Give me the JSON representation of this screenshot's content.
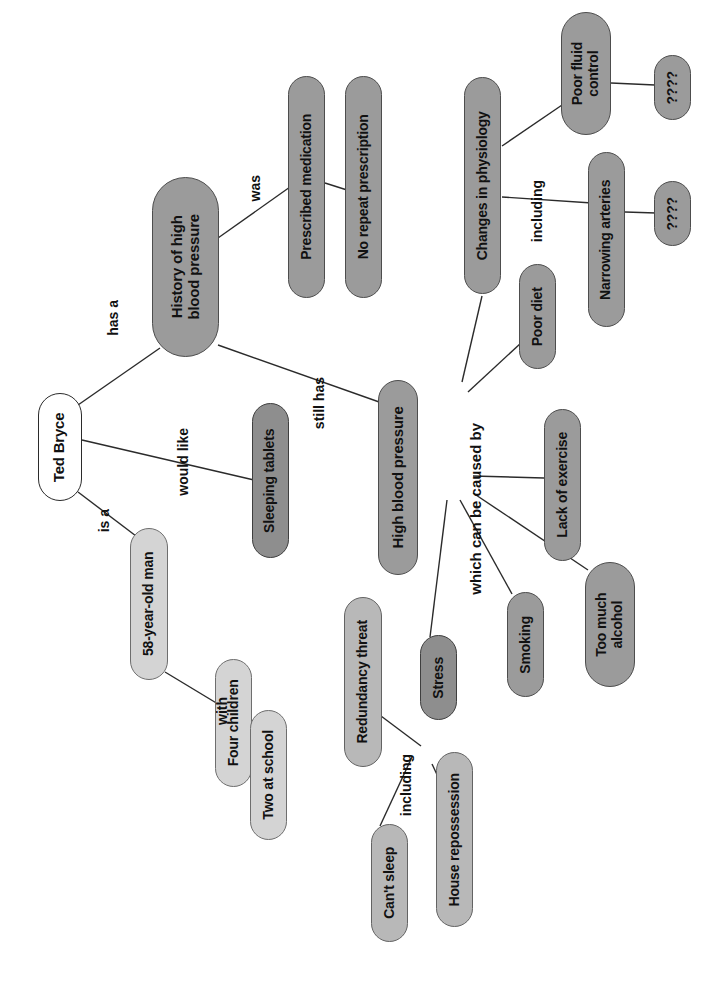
{
  "diagram": {
    "orientation": "rotated-90-ccw",
    "background_color": "#ffffff",
    "palette": {
      "root_fill": "#ffffff",
      "light_fill": "#d4d4d4",
      "mid_fill": "#b8b8b8",
      "dark_fill": "#9b9b9b",
      "darker_fill": "#8e8e8e",
      "stroke": "#4a4a4a",
      "text": "#111111",
      "edge": "#2b2b2b"
    },
    "nodes": [
      {
        "id": "ted",
        "label": "Ted Bryce",
        "fill": "white",
        "x": 38,
        "y": 393,
        "w": 44,
        "h": 108,
        "fs": 15
      },
      {
        "id": "history",
        "label": "History of high\nblood pressure",
        "fill": "dark",
        "x": 152,
        "y": 177,
        "w": 67,
        "h": 180,
        "fs": 15
      },
      {
        "id": "prescribed",
        "label": "Prescribed medication",
        "fill": "dark",
        "x": 288,
        "y": 76,
        "w": 37,
        "h": 222,
        "fs": 14
      },
      {
        "id": "norepeat",
        "label": "No repeat prescription",
        "fill": "dark",
        "x": 345,
        "y": 76,
        "w": 37,
        "h": 222,
        "fs": 14
      },
      {
        "id": "changes",
        "label": "Changes in physiology",
        "fill": "dark",
        "x": 464,
        "y": 77,
        "w": 37,
        "h": 217,
        "fs": 14
      },
      {
        "id": "poorfluid",
        "label": "Poor fluid\ncontrol",
        "fill": "dark",
        "x": 561,
        "y": 12,
        "w": 50,
        "h": 123,
        "fs": 14
      },
      {
        "id": "q1",
        "label": "????",
        "fill": "dark",
        "x": 654,
        "y": 55,
        "w": 37,
        "h": 65,
        "fs": 14
      },
      {
        "id": "narrowing",
        "label": "Narrowing arteries",
        "fill": "dark",
        "x": 588,
        "y": 152,
        "w": 37,
        "h": 175,
        "fs": 14
      },
      {
        "id": "q2",
        "label": "????",
        "fill": "dark",
        "x": 654,
        "y": 181,
        "w": 37,
        "h": 65,
        "fs": 14
      },
      {
        "id": "poordiet",
        "label": "Poor diet",
        "fill": "dark",
        "x": 519,
        "y": 264,
        "w": 37,
        "h": 105,
        "fs": 14
      },
      {
        "id": "sleeping",
        "label": "Sleeping tablets",
        "fill": "darker",
        "x": 252,
        "y": 403,
        "w": 37,
        "h": 155,
        "fs": 14
      },
      {
        "id": "highbp",
        "label": "High blood pressure",
        "fill": "dark",
        "x": 378,
        "y": 380,
        "w": 40,
        "h": 195,
        "fs": 15
      },
      {
        "id": "lackex",
        "label": "Lack of exercise",
        "fill": "dark",
        "x": 544,
        "y": 409,
        "w": 37,
        "h": 152,
        "fs": 14
      },
      {
        "id": "toomuch",
        "label": "Too much\nalcohol",
        "fill": "dark",
        "x": 585,
        "y": 562,
        "w": 50,
        "h": 125,
        "fs": 14
      },
      {
        "id": "smoking",
        "label": "Smoking",
        "fill": "dark",
        "x": 507,
        "y": 592,
        "w": 37,
        "h": 105,
        "fs": 14
      },
      {
        "id": "stress",
        "label": "Stress",
        "fill": "darker",
        "x": 420,
        "y": 635,
        "w": 37,
        "h": 85,
        "fs": 14
      },
      {
        "id": "man58",
        "label": "58-year-old man",
        "fill": "light",
        "x": 130,
        "y": 528,
        "w": 38,
        "h": 152,
        "fs": 14
      },
      {
        "id": "fourkids",
        "label": "Four children",
        "fill": "light",
        "x": 215,
        "y": 659,
        "w": 37,
        "h": 128,
        "fs": 14
      },
      {
        "id": "twoschool",
        "label": "Two at school",
        "fill": "light",
        "x": 250,
        "y": 710,
        "w": 37,
        "h": 130,
        "fs": 14
      },
      {
        "id": "redundancy",
        "label": "Redundancy threat",
        "fill": "mid",
        "x": 344,
        "y": 597,
        "w": 38,
        "h": 170,
        "fs": 14
      },
      {
        "id": "cantsleep",
        "label": "Can't sleep",
        "fill": "mid",
        "x": 371,
        "y": 824,
        "w": 37,
        "h": 118,
        "fs": 14
      },
      {
        "id": "houserep",
        "label": "House repossession",
        "fill": "mid",
        "x": 436,
        "y": 752,
        "w": 37,
        "h": 175,
        "fs": 14
      }
    ],
    "edge_labels": [
      {
        "id": "has-a",
        "text": "has a",
        "x": 105,
        "y": 300,
        "fs": 14
      },
      {
        "id": "would-like",
        "text": "would like",
        "x": 175,
        "y": 428,
        "fs": 14
      },
      {
        "id": "is-a",
        "text": "is a",
        "x": 96,
        "y": 509,
        "fs": 14
      },
      {
        "id": "was",
        "text": "was",
        "x": 247,
        "y": 175,
        "fs": 14
      },
      {
        "id": "still-has",
        "text": "still has",
        "x": 311,
        "y": 377,
        "fs": 14
      },
      {
        "id": "including-1",
        "text": "including",
        "x": 529,
        "y": 180,
        "fs": 14
      },
      {
        "id": "caused-by",
        "text": "which can be caused by",
        "x": 467,
        "y": 423,
        "fs": 15
      },
      {
        "id": "with",
        "text": "with",
        "x": 214,
        "y": 697,
        "fs": 14
      },
      {
        "id": "including-2",
        "text": "including",
        "x": 398,
        "y": 754,
        "fs": 14
      }
    ],
    "edges": [
      {
        "from": "ted",
        "to": "history",
        "label": "has a",
        "x1": 78,
        "y1": 405,
        "x2": 160,
        "y2": 348
      },
      {
        "from": "ted",
        "to": "sleeping",
        "label": "would like",
        "x1": 82,
        "y1": 440,
        "x2": 254,
        "y2": 480
      },
      {
        "from": "ted",
        "to": "man58",
        "label": "is a",
        "x1": 78,
        "y1": 492,
        "x2": 136,
        "y2": 536
      },
      {
        "from": "history",
        "to": "prescribed",
        "label": "was",
        "x1": 218,
        "y1": 238,
        "x2": 290,
        "y2": 187
      },
      {
        "from": "history",
        "to": "highbp",
        "label": "still has",
        "x1": 218,
        "y1": 345,
        "x2": 382,
        "y2": 403
      },
      {
        "from": "prescribed",
        "to": "norepeat",
        "label": "",
        "x1": 325,
        "y1": 183,
        "x2": 347,
        "y2": 190
      },
      {
        "from": "changes",
        "to": "poorfluid",
        "label": "including",
        "x1": 502,
        "y1": 146,
        "x2": 565,
        "y2": 103
      },
      {
        "from": "changes",
        "to": "narrowing",
        "label": "",
        "x1": 502,
        "y1": 197,
        "x2": 592,
        "y2": 203
      },
      {
        "from": "poorfluid",
        "to": "q1",
        "label": "",
        "x1": 611,
        "y1": 83,
        "x2": 655,
        "y2": 85
      },
      {
        "from": "narrowing",
        "to": "q2",
        "label": "",
        "x1": 625,
        "y1": 212,
        "x2": 656,
        "y2": 213
      },
      {
        "from": "highbp",
        "to": "changes",
        "label": "",
        "x1": 462,
        "y1": 382,
        "x2": 482,
        "y2": 296
      },
      {
        "from": "highbp",
        "to": "poordiet",
        "label": "",
        "x1": 468,
        "y1": 392,
        "x2": 521,
        "y2": 343
      },
      {
        "from": "highbp",
        "to": "lackex",
        "label": "",
        "x1": 473,
        "y1": 476,
        "x2": 544,
        "y2": 478
      },
      {
        "from": "highbp",
        "to": "toomuch",
        "label": "",
        "x1": 473,
        "y1": 493,
        "x2": 588,
        "y2": 570
      },
      {
        "from": "highbp",
        "to": "smoking",
        "label": "",
        "x1": 460,
        "y1": 500,
        "x2": 512,
        "y2": 594
      },
      {
        "from": "highbp",
        "to": "stress",
        "label": "",
        "x1": 447,
        "y1": 500,
        "x2": 430,
        "y2": 637
      },
      {
        "from": "man58",
        "to": "fourkids",
        "label": "with",
        "x1": 165,
        "y1": 672,
        "x2": 218,
        "y2": 704
      },
      {
        "from": "fourkids",
        "to": "twoschool",
        "label": "",
        "x1": 250,
        "y1": 730,
        "x2": 254,
        "y2": 734
      },
      {
        "from": "stress",
        "to": "redundancy",
        "label": "including",
        "x1": 421,
        "y1": 746,
        "x2": 381,
        "y2": 716
      },
      {
        "from": "stress",
        "to": "cantsleep",
        "label": "",
        "x1": 412,
        "y1": 757,
        "x2": 380,
        "y2": 826
      },
      {
        "from": "stress",
        "to": "houserep",
        "label": "",
        "x1": 432,
        "y1": 764,
        "x2": 440,
        "y2": 781
      }
    ]
  }
}
